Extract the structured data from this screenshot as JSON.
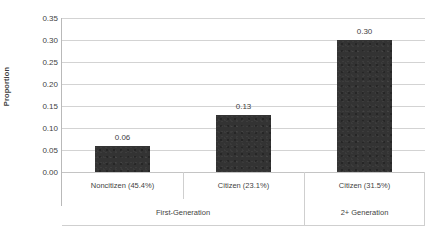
{
  "chart_data": {
    "type": "bar",
    "title": "",
    "xlabel": "",
    "ylabel": "Proportion",
    "ylim": [
      0.0,
      0.35
    ],
    "ytick_step": 0.05,
    "grid": true,
    "legend": "none",
    "bar_color": "#333333",
    "gridline_color": "#d3d3d3",
    "background_color": "#ffffff",
    "categories": [
      "Noncitizen (45.4%)",
      "Citizen (23.1%)",
      "Citizen (31.5%)"
    ],
    "values": [
      0.06,
      0.13,
      0.3
    ],
    "value_labels": [
      "0.06",
      "0.13",
      "0.30"
    ],
    "groups": [
      {
        "label": "First-Generation",
        "category_indices": [
          0,
          1
        ]
      },
      {
        "label": "2+ Generation",
        "category_indices": [
          2
        ]
      }
    ],
    "ytick_labels": [
      "0.35",
      "0.30",
      "0.25",
      "0.20",
      "0.15",
      "0.10",
      "0.05",
      "0.00"
    ],
    "ytick_values": [
      0.35,
      0.3,
      0.25,
      0.2,
      0.15,
      0.1,
      0.05,
      0.0
    ]
  }
}
